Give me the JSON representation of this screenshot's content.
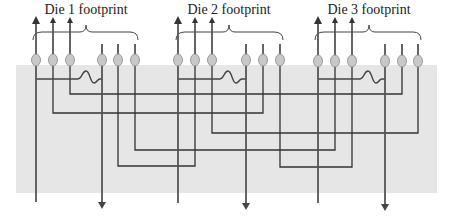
{
  "labels": {
    "die1": "Die 1 footprint",
    "die2": "Die 2 footprint",
    "die3": "Die 3 footprint"
  },
  "colors": {
    "background": "#ffffff",
    "band": "#e6e6e6",
    "pin": "#555555",
    "trace": "#333333",
    "bubble_fill": "#c8c8c8",
    "bubble_stroke": "#888888",
    "text": "#222222"
  },
  "dies": [
    {
      "name": "Die 1",
      "pins_x": [
        36,
        53,
        70,
        102,
        118,
        135
      ],
      "label_x": 86
    },
    {
      "name": "Die 2",
      "pins_x": [
        178,
        195,
        212,
        246,
        263,
        280
      ],
      "label_x": 229
    },
    {
      "name": "Die 3",
      "pins_x": [
        318,
        335,
        352,
        385,
        402,
        418
      ],
      "label_x": 369
    }
  ],
  "connections": [
    {
      "from": "Die 1 pin 3",
      "to": "Die 3 pin 5",
      "y": 94
    },
    {
      "from": "Die 1 pin 2",
      "to": "Die 2 pin 5",
      "y": 113
    },
    {
      "from": "Die 2 pin 3",
      "to": "Die 3 pin 6",
      "y": 133
    },
    {
      "from": "Die 1 pin 6",
      "to": "Die 3 pin 2",
      "y": 150
    },
    {
      "from": "Die 1 pin 5",
      "to": "Die 2 pin 2",
      "y": 166
    },
    {
      "from": "Die 2 pin 6",
      "to": "Die 3 pin 3",
      "y": 167
    }
  ]
}
